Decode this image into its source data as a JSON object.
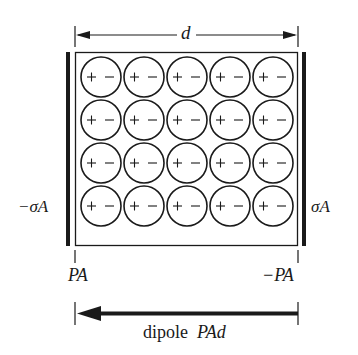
{
  "diagram": {
    "width_label": "d",
    "left_plate_charge": "−σA",
    "right_plate_charge": "σA",
    "left_surface_charge": "PA",
    "right_surface_charge": "−PA",
    "dipole_label_text": "dipole",
    "dipole_label_math": "PAd",
    "dipole_arrow_direction": "left",
    "grid": {
      "rows": 4,
      "cols": 5,
      "cell_sign_left": "+",
      "cell_sign_right": "−"
    },
    "colors": {
      "ink": "#1a1a1a",
      "background": "#ffffff"
    }
  }
}
